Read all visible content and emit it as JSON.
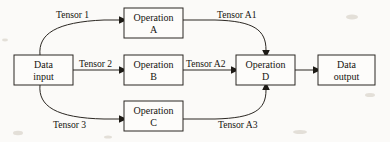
{
  "diagram": {
    "type": "flow-diagram",
    "colors": {
      "background": "#fbfaf8",
      "stroke": "#2b2722",
      "text": "#16140f",
      "box_fill": "#fdfcfa"
    },
    "nodes": [
      {
        "id": "data-input",
        "line1": "Data",
        "line2": "input",
        "x": 14,
        "y": 55,
        "w": 59,
        "h": 30
      },
      {
        "id": "operation-a",
        "line1": "Operation",
        "line2": "A",
        "x": 124,
        "y": 8,
        "w": 59,
        "h": 30
      },
      {
        "id": "operation-b",
        "line1": "Operation",
        "line2": "B",
        "x": 124,
        "y": 55,
        "w": 59,
        "h": 30
      },
      {
        "id": "operation-c",
        "line1": "Operation",
        "line2": "C",
        "x": 124,
        "y": 101,
        "w": 59,
        "h": 30
      },
      {
        "id": "operation-d",
        "line1": "Operation",
        "line2": "D",
        "x": 236,
        "y": 55,
        "w": 59,
        "h": 30
      },
      {
        "id": "data-output",
        "line1": "Data",
        "line2": "output",
        "x": 318,
        "y": 55,
        "w": 57,
        "h": 30
      }
    ],
    "edges": [
      {
        "id": "tensor-1",
        "label": "Tensor 1",
        "from": "data-input",
        "to": "operation-a",
        "label_x": 56,
        "label_y": 18
      },
      {
        "id": "tensor-2",
        "label": "Tensor 2",
        "from": "data-input",
        "to": "operation-b",
        "label_x": 79,
        "label_y": 67
      },
      {
        "id": "tensor-3",
        "label": "Tensor 3",
        "from": "data-input",
        "to": "operation-c",
        "label_x": 53,
        "label_y": 128
      },
      {
        "id": "tensor-a1",
        "label": "Tensor A1",
        "from": "operation-a",
        "to": "operation-d",
        "label_x": 217,
        "label_y": 18
      },
      {
        "id": "tensor-a2",
        "label": "Tensor A2",
        "from": "operation-b",
        "to": "operation-d",
        "label_x": 186,
        "label_y": 67
      },
      {
        "id": "tensor-a3",
        "label": "Tensor A3",
        "from": "operation-c",
        "to": "operation-d",
        "label_x": 218,
        "label_y": 128
      },
      {
        "id": "output-edge",
        "label": "",
        "from": "operation-d",
        "to": "data-output",
        "label_x": 0,
        "label_y": 0
      }
    ]
  }
}
